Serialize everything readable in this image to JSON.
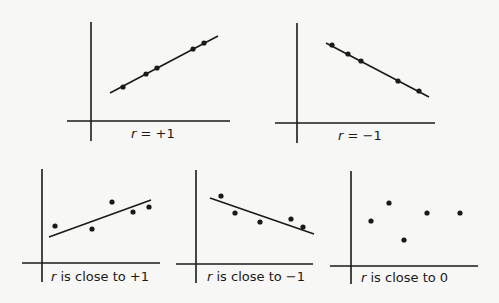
{
  "colors": {
    "ink": "#1a1a1a",
    "background": "#f7f7f5"
  },
  "chart_data": [
    {
      "type": "scatter",
      "title": "r = +1",
      "label_var": "r",
      "label_rest": " = +1",
      "trend_line": "perfect positive",
      "grid": false,
      "points_px": [
        [
          123,
          87
        ],
        [
          146,
          74
        ],
        [
          157,
          68
        ],
        [
          193,
          49
        ],
        [
          204,
          43
        ]
      ],
      "line_px": [
        [
          110,
          93
        ],
        [
          218,
          36
        ]
      ]
    },
    {
      "type": "scatter",
      "title": "r = −1",
      "label_var": "r",
      "label_rest": " = −1",
      "trend_line": "perfect negative",
      "grid": false,
      "points_px": [
        [
          332,
          45
        ],
        [
          348,
          54
        ],
        [
          361,
          61
        ],
        [
          398,
          81
        ],
        [
          419,
          91
        ]
      ],
      "line_px": [
        [
          326,
          43
        ],
        [
          429,
          97
        ]
      ]
    },
    {
      "type": "scatter",
      "title": "r is close to +1",
      "label_var": "r",
      "label_rest": " is close to +1",
      "trend_line": "strong positive",
      "grid": false,
      "points_px": [
        [
          55,
          226
        ],
        [
          92,
          229
        ],
        [
          112,
          202
        ],
        [
          133,
          212
        ],
        [
          149,
          207
        ]
      ],
      "line_px": [
        [
          49,
          237
        ],
        [
          151,
          200
        ]
      ]
    },
    {
      "type": "scatter",
      "title": "r is close to −1",
      "label_var": "r",
      "label_rest": " is close to −1",
      "trend_line": "strong negative",
      "grid": false,
      "points_px": [
        [
          221,
          196
        ],
        [
          235,
          213
        ],
        [
          260,
          222
        ],
        [
          291,
          219
        ],
        [
          303,
          227
        ]
      ],
      "line_px": [
        [
          210,
          198
        ],
        [
          314,
          234
        ]
      ]
    },
    {
      "type": "scatter",
      "title": "r is close to 0",
      "label_var": "r",
      "label_rest": " is close to 0",
      "trend_line": "none",
      "grid": false,
      "points_px": [
        [
          371,
          221
        ],
        [
          389,
          203
        ],
        [
          404,
          240
        ],
        [
          427,
          213
        ],
        [
          460,
          213
        ]
      ],
      "line_px": null
    }
  ]
}
